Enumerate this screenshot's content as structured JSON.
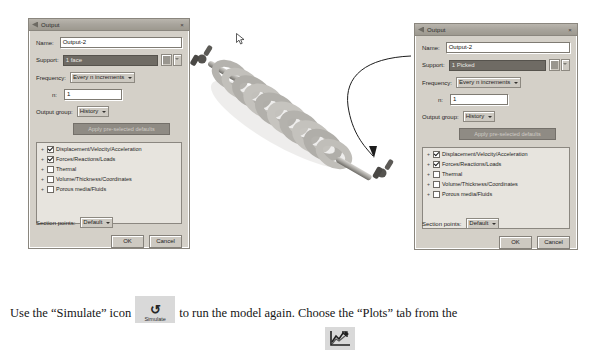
{
  "dialogs": [
    {
      "title": "Output",
      "name_label": "Name:",
      "name_value": "Output-2",
      "support_label": "Support:",
      "support_value": "1 face",
      "frequency_label": "Frequency:",
      "frequency_value": "Every n increments",
      "n_label": "n:",
      "n_value": "1",
      "output_group_label": "Output group:",
      "output_group_value": "History",
      "apply_defaults_label": "Apply pre-selected defaults",
      "tree_items": [
        {
          "label": "Displacement/Velocity/Acceleration",
          "checked": true
        },
        {
          "label": "Forces/Reactions/Loads",
          "checked": true
        },
        {
          "label": "Thermal",
          "checked": false
        },
        {
          "label": "Volume/Thickness/Coordinates",
          "checked": false
        },
        {
          "label": "Porous media/Fluids",
          "checked": false
        }
      ],
      "section_points_label": "Section points:",
      "section_points_value": "Default",
      "ok_label": "OK",
      "cancel_label": "Cancel",
      "close_label": "×"
    },
    {
      "title": "Output",
      "name_label": "Name:",
      "name_value": "Output-2",
      "support_label": "Support:",
      "support_value": "1 Picked",
      "frequency_label": "Frequency:",
      "frequency_value": "Every n increments",
      "n_label": "n:",
      "n_value": "1",
      "output_group_label": "Output group:",
      "output_group_value": "History",
      "apply_defaults_label": "Apply pre-selected defaults",
      "tree_items": [
        {
          "label": "Displacement/Velocity/Acceleration",
          "checked": true
        },
        {
          "label": "Forces/Reactions/Loads",
          "checked": true
        },
        {
          "label": "Thermal",
          "checked": false
        },
        {
          "label": "Volume/Thickness/Coordinates",
          "checked": false
        },
        {
          "label": "Porous media/Fluids",
          "checked": false
        }
      ],
      "section_points_label": "Section points:",
      "section_points_value": "Default",
      "ok_label": "OK",
      "cancel_label": "Cancel",
      "close_label": "×"
    }
  ],
  "viewport": {
    "model_name": "coil-spring-assembly",
    "annotation_arrow": "curved-arrow-pointing-to-lower-end-fitting",
    "cursor": "arrow-cursor"
  },
  "caption": {
    "part1": "Use the “Simulate” icon",
    "part2": "to run the model again. Choose the “Plots” tab from the",
    "simulate_icon_symbol": "↺",
    "simulate_icon_label": "Simulate"
  },
  "plots_icon": {
    "name": "plots-chart-icon"
  },
  "colors": {
    "dialog_face": "#d4d0c8",
    "titlebar": "#a8a49c",
    "support_highlight": "#6f6b64",
    "tree_background": "#e7e4de",
    "icon_background": "#d9d9d9"
  }
}
